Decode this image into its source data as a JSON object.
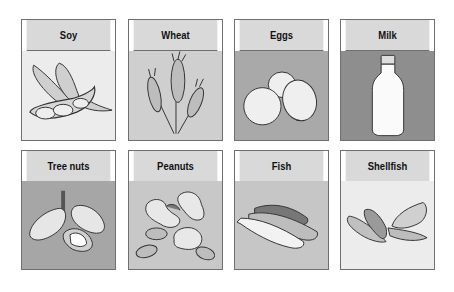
{
  "cards": [
    {
      "label": "Soy",
      "icon": "soybean-pod-icon",
      "bg": "#ececec"
    },
    {
      "label": "Wheat",
      "icon": "wheat-icon",
      "bg": "#cfcfcf"
    },
    {
      "label": "Eggs",
      "icon": "eggs-icon",
      "bg": "#a9a9a9"
    },
    {
      "label": "Milk",
      "icon": "milk-bottle-icon",
      "bg": "#8e8e8e"
    },
    {
      "label": "Tree nuts",
      "icon": "tree-nuts-icon",
      "bg": "#a6a6a6"
    },
    {
      "label": "Peanuts",
      "icon": "peanuts-icon",
      "bg": "#c8c8c8"
    },
    {
      "label": "Fish",
      "icon": "fish-icon",
      "bg": "#c6c6c6"
    },
    {
      "label": "Shellfish",
      "icon": "shellfish-icon",
      "bg": "#ececec"
    }
  ]
}
